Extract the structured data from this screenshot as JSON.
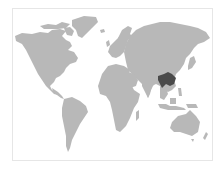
{
  "map": {
    "type": "world-locator-map",
    "projection": "equirectangular-like",
    "colors": {
      "background": "#ffffff",
      "frame": "#e6e6e6",
      "land": "#b8b8b8",
      "highlight": "#4a4a4a"
    },
    "highlight": {
      "region": "southern China",
      "approx_center_px": [
        168,
        79
      ]
    },
    "regions": [
      "north-america",
      "greenland",
      "south-america",
      "europe",
      "africa",
      "asia",
      "arabia",
      "india",
      "southeast-asia",
      "indonesia",
      "australia",
      "new-zealand",
      "japan",
      "uk",
      "madagascar"
    ]
  }
}
